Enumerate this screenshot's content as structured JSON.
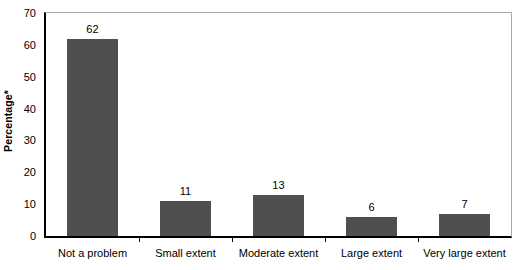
{
  "chart_data": {
    "type": "bar",
    "title": "",
    "subtitle": "",
    "xlabel": "",
    "ylabel": "Percentage*",
    "categories": [
      "Not a problem",
      "Small extent",
      "Moderate extent",
      "Large extent",
      "Very large extent"
    ],
    "values": [
      62,
      11,
      13,
      6,
      7
    ],
    "value_labels": [
      "62",
      "11",
      "13",
      "6",
      "7"
    ],
    "ylim": [
      0,
      70
    ],
    "ytick_values": [
      0,
      10,
      20,
      30,
      40,
      50,
      60,
      70
    ],
    "ytick_labels": [
      "0",
      "10",
      "20",
      "30",
      "40",
      "50",
      "60",
      "70"
    ],
    "grid": false,
    "legend": false,
    "legend_position": "none",
    "bar_color": "#4f4f4f",
    "axis_color": "#000000",
    "frame_color": "#a8a8a8",
    "background_color": "#ffffff"
  }
}
